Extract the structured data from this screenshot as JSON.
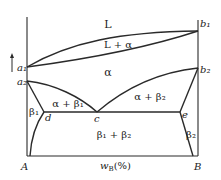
{
  "diagram": {
    "type": "binary phase diagram",
    "regions": {
      "liquid": "L",
      "liquid_alpha": "L + α",
      "alpha": "α",
      "alpha_beta1": "α + β₁",
      "alpha_beta2": "α + β₂",
      "beta1": "β₁",
      "beta2": "β₂",
      "beta1_beta2": "β₁ + β₂"
    },
    "points": {
      "a1": "a₁",
      "a2": "a₂",
      "b1": "b₁",
      "b2": "b₂",
      "c": "c",
      "d": "d",
      "e": "e"
    },
    "axis": {
      "left_component": "A",
      "right_component": "B",
      "x_label": "w_B(%)",
      "x_label_main": "w",
      "x_label_sub": "B",
      "x_label_tail": "(%)"
    },
    "colors": {
      "line": "#2a2a2a",
      "text": "#222222"
    }
  }
}
